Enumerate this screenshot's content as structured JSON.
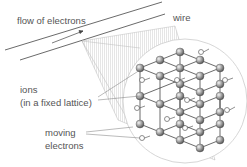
{
  "diagram": {
    "labels": {
      "flow": "flow of electrons",
      "wire": "wire",
      "ions_line1": "ions",
      "ions_line2": "(in a fixed lattice)",
      "moving_line1": "moving",
      "moving_line2": "electrons"
    },
    "colors": {
      "line": "#444444",
      "text": "#555555",
      "ion": "#8a8a8a",
      "circle": "#cccccc"
    }
  }
}
